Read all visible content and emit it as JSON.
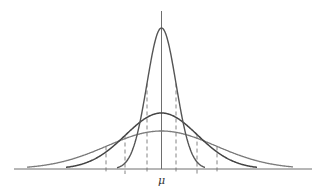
{
  "diagram": {
    "title": "",
    "axis": {
      "center_label": "μ",
      "baseline_y": 169,
      "center_x": 161.5,
      "x_start": 14,
      "x_end": 312,
      "axis_top_y": 11
    },
    "colors": {
      "axis": "#6e6e6e",
      "curve_narrow": "#555555",
      "curve_medium": "#444444",
      "curve_wide": "#7a7a7a",
      "dashed": "#777777"
    },
    "curves": [
      {
        "name": "narrow",
        "sigma": 14.5,
        "height": 141,
        "x_min": 117,
        "x_max": 205
      },
      {
        "name": "medium",
        "sigma": 36,
        "height": 56,
        "x_min": 66,
        "x_max": 257
      },
      {
        "name": "wide",
        "sigma": 54.5,
        "height": 38,
        "x_min": 27,
        "x_max": 293
      }
    ],
    "dashed_lines": [
      {
        "x": 106,
        "curve": "wide"
      },
      {
        "x": 125,
        "curve": "medium"
      },
      {
        "x": 147,
        "curve": "narrow"
      },
      {
        "x": 176,
        "curve": "narrow"
      },
      {
        "x": 197,
        "curve": "medium"
      },
      {
        "x": 217,
        "curve": "wide"
      }
    ]
  }
}
